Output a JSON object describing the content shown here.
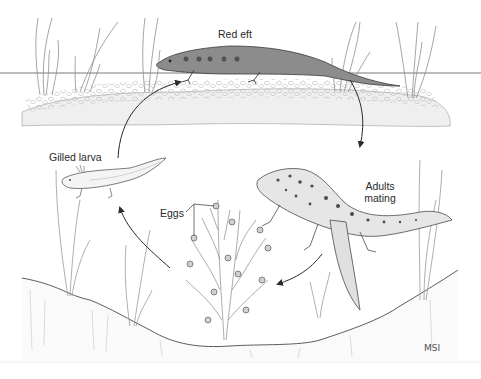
{
  "figure": {
    "stages": [
      {
        "id": "red_eft",
        "label": "Red eft"
      },
      {
        "id": "adults_mating",
        "label_line1": "Adults",
        "label_line2": "mating"
      },
      {
        "id": "eggs",
        "label": "Eggs"
      },
      {
        "id": "gilled_larva",
        "label": "Gilled larva"
      }
    ],
    "signature": "MSI",
    "colors": {
      "line": "#3a3a3a",
      "pencil": "#8a8a8a",
      "light": "#bdbdbd",
      "ground": "#f2f2f2",
      "spot": "#5a5a5a"
    }
  }
}
